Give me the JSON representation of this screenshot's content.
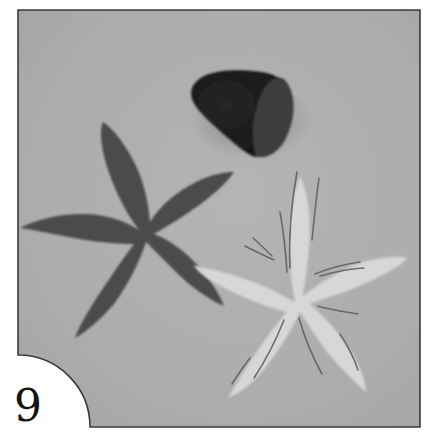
{
  "figure": {
    "step_number": "9",
    "colors": {
      "page_background": "#ffffff",
      "photo_background": "#c4c4c4",
      "photo_border": "#3a3a3a",
      "dark_flower": "#4a4a4a",
      "light_flower": "#d6d6d6",
      "light_flower_veins": "#5a5a5a",
      "cone_tool": "#1e1e1e",
      "cone_tool_face": "#3e3e3e",
      "step_number": "#141414"
    },
    "objects": [
      {
        "name": "cone-tool",
        "description": "dark foam cone shaping tool"
      },
      {
        "name": "dark-flower-cutout",
        "description": "dark five-petal flower cutout"
      },
      {
        "name": "light-flower-cutout",
        "description": "light five-petal flower cutout with veined petals"
      }
    ]
  }
}
